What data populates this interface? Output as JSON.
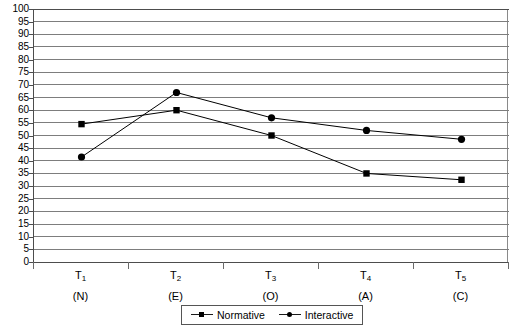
{
  "chart_data": {
    "type": "line",
    "title": "",
    "xlabel": "",
    "ylabel": "",
    "ylim": [
      0,
      100
    ],
    "y_ticks": [
      0,
      5,
      10,
      15,
      20,
      25,
      30,
      35,
      40,
      45,
      50,
      55,
      60,
      65,
      70,
      75,
      80,
      85,
      90,
      95,
      100
    ],
    "grid": true,
    "legend_position": "bottom-center",
    "categories": [
      "T1",
      "T2",
      "T3",
      "T4",
      "T5"
    ],
    "category_labels": [
      {
        "main": "T",
        "index": "1",
        "sub": "(N)"
      },
      {
        "main": "T",
        "index": "2",
        "sub": "(E)"
      },
      {
        "main": "T",
        "index": "3",
        "sub": "(O)"
      },
      {
        "main": "T",
        "index": "4",
        "sub": "(A)"
      },
      {
        "main": "T",
        "index": "5",
        "sub": "(C)"
      }
    ],
    "series": [
      {
        "name": "Normative",
        "marker": "square",
        "color": "#000000",
        "values": [
          54.5,
          60,
          50,
          35,
          32.5
        ]
      },
      {
        "name": "Interactive",
        "marker": "circle",
        "color": "#000000",
        "values": [
          41.5,
          67,
          57,
          52,
          48.5
        ]
      }
    ]
  },
  "legend": {
    "items": [
      {
        "label": "Normative",
        "marker": "square"
      },
      {
        "label": "Interactive",
        "marker": "circle"
      }
    ]
  }
}
